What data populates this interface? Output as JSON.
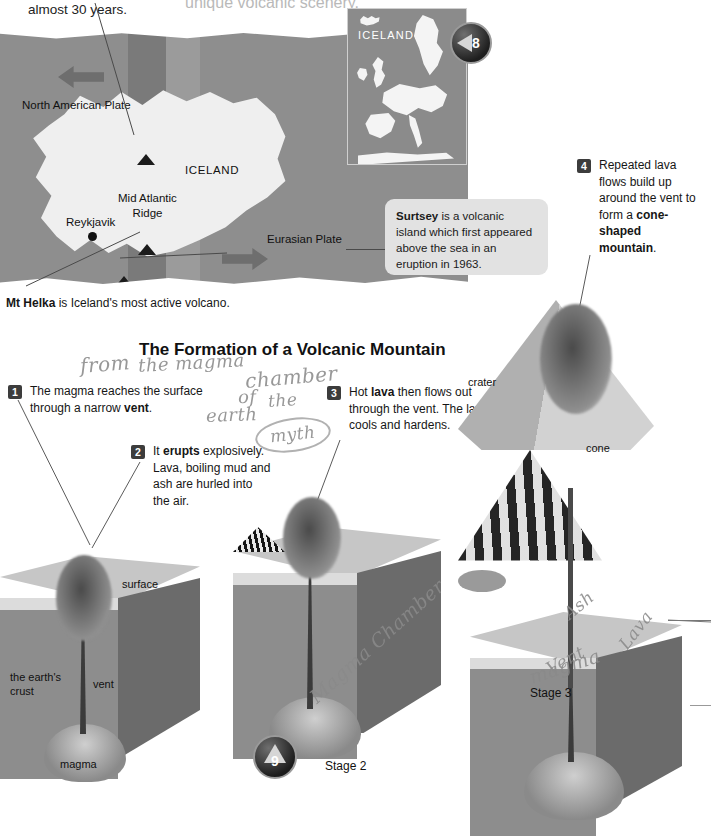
{
  "page": {
    "top_continuation_text": "almost 30 years.",
    "top_faded_text": "unique volcanic scenery.",
    "badge_left": "8",
    "badge_right": "9"
  },
  "map": {
    "labels": {
      "north_american_plate": "North American Plate",
      "iceland": "ICELAND",
      "mid_atlantic_ridge_line1": "Mid Atlantic",
      "mid_atlantic_ridge_line2": "Ridge",
      "reykjavik": "Reykjavik",
      "eurasian_plate": "Eurasian Plate"
    },
    "inset_label": "ICELAND",
    "caption_bold": "Mt Helka",
    "caption_rest": " is Iceland's most active volcano."
  },
  "surtsey_callout": {
    "bold": "Surtsey",
    "text": " is a volcanic island which first appeared above the sea in an eruption in 1963."
  },
  "section": {
    "title": "The Formation of a Volcanic Mountain"
  },
  "steps": [
    {
      "number": "1",
      "parts": [
        {
          "text": "The magma reaches the surface through a narrow ",
          "bold": false
        },
        {
          "text": "vent",
          "bold": true
        },
        {
          "text": ".",
          "bold": false
        }
      ]
    },
    {
      "number": "2",
      "parts": [
        {
          "text": "It ",
          "bold": false
        },
        {
          "text": "erupts",
          "bold": true
        },
        {
          "text": " explosively. Lava, boiling mud and ash are hurled into the air.",
          "bold": false
        }
      ]
    },
    {
      "number": "3",
      "parts": [
        {
          "text": "Hot ",
          "bold": false
        },
        {
          "text": "lava",
          "bold": true
        },
        {
          "text": " then flows out through the vent. The lava cools and hardens.",
          "bold": false
        }
      ]
    },
    {
      "number": "4",
      "parts": [
        {
          "text": "Repeated lava flows build up around the vent to form a ",
          "bold": false
        },
        {
          "text": "cone-shaped mountain",
          "bold": true
        },
        {
          "text": ".",
          "bold": false
        }
      ]
    }
  ],
  "diagrams": {
    "stage1": {
      "labels": {
        "surface": "surface",
        "crust_line1": "the earth's",
        "crust_line2": "crust",
        "vent": "vent",
        "magma": "magma"
      }
    },
    "stage2": {
      "caption": "Stage 2"
    },
    "stage3": {
      "caption": "Stage 3",
      "labels": {
        "crater": "crater",
        "cone": "cone"
      }
    }
  },
  "handwriting": {
    "from": "from",
    "the_magma": "the magma",
    "chamber": "chamber",
    "of": "of",
    "the": "the",
    "earth": "earth",
    "myth": "myth",
    "magma_chamber": "Magma Chamber",
    "ash": "Ash",
    "vent": "Vent",
    "lava": "Lava",
    "magma": "magma"
  },
  "colors": {
    "ocean": "#8e8e8e",
    "land": "#efefef",
    "ridge_dark": "#7a7a7a",
    "ridge_light": "#9b9b9b",
    "callout_bg": "#e2e2e2",
    "step_badge": "#3c3c3c",
    "handwriting": "#8a8a8a"
  }
}
